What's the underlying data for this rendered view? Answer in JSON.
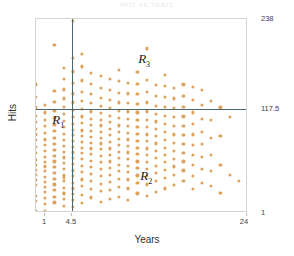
{
  "figure": {
    "title_faint": "Hits vs Years",
    "xlabel": "Years",
    "ylabel": "Hits"
  },
  "axes": {
    "x_ticks": [
      {
        "label": "1",
        "pos": 0.0425
      },
      {
        "label": "4.5",
        "pos": 0.17
      }
    ],
    "x_right_tick": {
      "label": "24",
      "pos": 1.0
    },
    "y_ticks": [
      {
        "label": "238",
        "pos": 1.0
      },
      {
        "label": "117.5",
        "pos": 0.537
      },
      {
        "label": "1",
        "pos": 0.0
      }
    ]
  },
  "regions": [
    {
      "name": "R1",
      "letter": "R",
      "sub": "1",
      "x": 0.105,
      "y": 0.475
    },
    {
      "name": "R2",
      "letter": "R",
      "sub": "2",
      "x": 0.52,
      "y": 0.185
    },
    {
      "name": "R3",
      "letter": "R",
      "sub": "3",
      "x": 0.51,
      "y": 0.79
    }
  ],
  "splits": {
    "vertical": {
      "variable": "Years",
      "value": 4.5,
      "pos": 0.17
    },
    "horizontal": {
      "variable": "Hits",
      "value": 117.5,
      "pos": 0.537
    }
  },
  "colors": {
    "point": "#dfa25c",
    "split_line": "#4a6670",
    "frame": "#d4d4d4",
    "text": "#3d3d3d"
  },
  "chart_data": {
    "type": "scatter",
    "title": "Hits vs Years",
    "xlabel": "Years",
    "ylabel": "Hits",
    "xlim": [
      1,
      24
    ],
    "ylim": [
      1,
      238
    ],
    "grid": false,
    "legend": null,
    "annotations": [
      {
        "text": "R1",
        "x": 3.4,
        "y": 114
      },
      {
        "text": "R2",
        "x": 13.0,
        "y": 45
      },
      {
        "text": "R3",
        "x": 12.7,
        "y": 189
      }
    ],
    "reference_lines": [
      {
        "orientation": "vertical",
        "value": 4.5,
        "label": "Years = 4.5"
      },
      {
        "orientation": "horizontal",
        "value": 117.5,
        "label": "Hits = 117.5"
      }
    ],
    "points": [
      [
        1,
        16
      ],
      [
        1,
        22
      ],
      [
        1,
        35
      ],
      [
        1,
        41
      ],
      [
        1,
        48
      ],
      [
        1,
        54
      ],
      [
        1,
        60
      ],
      [
        1,
        66
      ],
      [
        1,
        74
      ],
      [
        1,
        82
      ],
      [
        1,
        90
      ],
      [
        1,
        97
      ],
      [
        1,
        104
      ],
      [
        1,
        112
      ],
      [
        1,
        120
      ],
      [
        1,
        130
      ],
      [
        1,
        143
      ],
      [
        1,
        158
      ],
      [
        1,
        4
      ],
      [
        2,
        12
      ],
      [
        2,
        19
      ],
      [
        2,
        27
      ],
      [
        2,
        33
      ],
      [
        2,
        39
      ],
      [
        2,
        45
      ],
      [
        2,
        52
      ],
      [
        2,
        58
      ],
      [
        2,
        63
      ],
      [
        2,
        70
      ],
      [
        2,
        77
      ],
      [
        2,
        84
      ],
      [
        2,
        91
      ],
      [
        2,
        99
      ],
      [
        2,
        107
      ],
      [
        2,
        115
      ],
      [
        2,
        124
      ],
      [
        2,
        133
      ],
      [
        2,
        3
      ],
      [
        3,
        14
      ],
      [
        3,
        21
      ],
      [
        3,
        29
      ],
      [
        3,
        36
      ],
      [
        3,
        43
      ],
      [
        3,
        50
      ],
      [
        3,
        57
      ],
      [
        3,
        64
      ],
      [
        3,
        71
      ],
      [
        3,
        78
      ],
      [
        3,
        85
      ],
      [
        3,
        93
      ],
      [
        3,
        101
      ],
      [
        3,
        109
      ],
      [
        3,
        117
      ],
      [
        3,
        126
      ],
      [
        3,
        137
      ],
      [
        3,
        150
      ],
      [
        3,
        206
      ],
      [
        4,
        10
      ],
      [
        4,
        18
      ],
      [
        4,
        25
      ],
      [
        4,
        32
      ],
      [
        4,
        40
      ],
      [
        4,
        47
      ],
      [
        4,
        55
      ],
      [
        4,
        62
      ],
      [
        4,
        69
      ],
      [
        4,
        76
      ],
      [
        4,
        83
      ],
      [
        4,
        90
      ],
      [
        4,
        98
      ],
      [
        4,
        106
      ],
      [
        4,
        114
      ],
      [
        4,
        122
      ],
      [
        4,
        131
      ],
      [
        4,
        141
      ],
      [
        4,
        152
      ],
      [
        4,
        165
      ],
      [
        4,
        178
      ],
      [
        4,
        26
      ],
      [
        4,
        44
      ],
      [
        5,
        8
      ],
      [
        5,
        17
      ],
      [
        5,
        24
      ],
      [
        5,
        31
      ],
      [
        5,
        38
      ],
      [
        5,
        46
      ],
      [
        5,
        53
      ],
      [
        5,
        61
      ],
      [
        5,
        68
      ],
      [
        5,
        75
      ],
      [
        5,
        82
      ],
      [
        5,
        89
      ],
      [
        5,
        96
      ],
      [
        5,
        103
      ],
      [
        5,
        110
      ],
      [
        5,
        118
      ],
      [
        5,
        127
      ],
      [
        5,
        136
      ],
      [
        5,
        147
      ],
      [
        5,
        160
      ],
      [
        5,
        174
      ],
      [
        5,
        190
      ],
      [
        5,
        236
      ],
      [
        6,
        13
      ],
      [
        6,
        23
      ],
      [
        6,
        34
      ],
      [
        6,
        42
      ],
      [
        6,
        51
      ],
      [
        6,
        59
      ],
      [
        6,
        67
      ],
      [
        6,
        74
      ],
      [
        6,
        81
      ],
      [
        6,
        88
      ],
      [
        6,
        95
      ],
      [
        6,
        102
      ],
      [
        6,
        111
      ],
      [
        6,
        119
      ],
      [
        6,
        128
      ],
      [
        6,
        138
      ],
      [
        6,
        149
      ],
      [
        6,
        163
      ],
      [
        6,
        180
      ],
      [
        6,
        195
      ],
      [
        7,
        20
      ],
      [
        7,
        30
      ],
      [
        7,
        40
      ],
      [
        7,
        49
      ],
      [
        7,
        57
      ],
      [
        7,
        65
      ],
      [
        7,
        73
      ],
      [
        7,
        80
      ],
      [
        7,
        87
      ],
      [
        7,
        94
      ],
      [
        7,
        101
      ],
      [
        7,
        109
      ],
      [
        7,
        116
      ],
      [
        7,
        125
      ],
      [
        7,
        135
      ],
      [
        7,
        146
      ],
      [
        7,
        159
      ],
      [
        7,
        172
      ],
      [
        8,
        15
      ],
      [
        8,
        28
      ],
      [
        8,
        37
      ],
      [
        8,
        46
      ],
      [
        8,
        55
      ],
      [
        8,
        63
      ],
      [
        8,
        71
      ],
      [
        8,
        79
      ],
      [
        8,
        86
      ],
      [
        8,
        93
      ],
      [
        8,
        100
      ],
      [
        8,
        108
      ],
      [
        8,
        115
      ],
      [
        8,
        123
      ],
      [
        8,
        132
      ],
      [
        8,
        142
      ],
      [
        8,
        154
      ],
      [
        8,
        168
      ],
      [
        9,
        18
      ],
      [
        9,
        29
      ],
      [
        9,
        39
      ],
      [
        9,
        48
      ],
      [
        9,
        56
      ],
      [
        9,
        64
      ],
      [
        9,
        72
      ],
      [
        9,
        80
      ],
      [
        9,
        88
      ],
      [
        9,
        96
      ],
      [
        9,
        104
      ],
      [
        9,
        112
      ],
      [
        9,
        120
      ],
      [
        9,
        129
      ],
      [
        9,
        139
      ],
      [
        9,
        151
      ],
      [
        9,
        165
      ],
      [
        10,
        21
      ],
      [
        10,
        33
      ],
      [
        10,
        43
      ],
      [
        10,
        52
      ],
      [
        10,
        60
      ],
      [
        10,
        68
      ],
      [
        10,
        76
      ],
      [
        10,
        84
      ],
      [
        10,
        92
      ],
      [
        10,
        100
      ],
      [
        10,
        108
      ],
      [
        10,
        117
      ],
      [
        10,
        126
      ],
      [
        10,
        136
      ],
      [
        10,
        148
      ],
      [
        10,
        162
      ],
      [
        10,
        176
      ],
      [
        11,
        17
      ],
      [
        11,
        31
      ],
      [
        11,
        42
      ],
      [
        11,
        51
      ],
      [
        11,
        59
      ],
      [
        11,
        67
      ],
      [
        11,
        75
      ],
      [
        11,
        83
      ],
      [
        11,
        91
      ],
      [
        11,
        99
      ],
      [
        11,
        107
      ],
      [
        11,
        116
      ],
      [
        11,
        125
      ],
      [
        11,
        135
      ],
      [
        11,
        147
      ],
      [
        11,
        160
      ],
      [
        12,
        25
      ],
      [
        12,
        38
      ],
      [
        12,
        47
      ],
      [
        12,
        56
      ],
      [
        12,
        64
      ],
      [
        12,
        73
      ],
      [
        12,
        81
      ],
      [
        12,
        89
      ],
      [
        12,
        98
      ],
      [
        12,
        106
      ],
      [
        12,
        115
      ],
      [
        12,
        124
      ],
      [
        12,
        134
      ],
      [
        12,
        146
      ],
      [
        12,
        159
      ],
      [
        12,
        173
      ],
      [
        13,
        22
      ],
      [
        13,
        36
      ],
      [
        13,
        46
      ],
      [
        13,
        55
      ],
      [
        13,
        63
      ],
      [
        13,
        72
      ],
      [
        13,
        80
      ],
      [
        13,
        89
      ],
      [
        13,
        97
      ],
      [
        13,
        106
      ],
      [
        13,
        115
      ],
      [
        13,
        125
      ],
      [
        13,
        136
      ],
      [
        13,
        149
      ],
      [
        13,
        164
      ],
      [
        13,
        202
      ],
      [
        14,
        27
      ],
      [
        14,
        40
      ],
      [
        14,
        50
      ],
      [
        14,
        59
      ],
      [
        14,
        68
      ],
      [
        14,
        77
      ],
      [
        14,
        86
      ],
      [
        14,
        95
      ],
      [
        14,
        104
      ],
      [
        14,
        113
      ],
      [
        14,
        122
      ],
      [
        14,
        132
      ],
      [
        14,
        144
      ],
      [
        14,
        157
      ],
      [
        15,
        31
      ],
      [
        15,
        44
      ],
      [
        15,
        54
      ],
      [
        15,
        63
      ],
      [
        15,
        72
      ],
      [
        15,
        81
      ],
      [
        15,
        90
      ],
      [
        15,
        100
      ],
      [
        15,
        110
      ],
      [
        15,
        120
      ],
      [
        15,
        131
      ],
      [
        15,
        143
      ],
      [
        15,
        156
      ],
      [
        15,
        170
      ],
      [
        16,
        35
      ],
      [
        16,
        48
      ],
      [
        16,
        58
      ],
      [
        16,
        67
      ],
      [
        16,
        77
      ],
      [
        16,
        87
      ],
      [
        16,
        97
      ],
      [
        16,
        107
      ],
      [
        16,
        118
      ],
      [
        16,
        129
      ],
      [
        16,
        141
      ],
      [
        16,
        154
      ],
      [
        17,
        40
      ],
      [
        17,
        53
      ],
      [
        17,
        64
      ],
      [
        17,
        74
      ],
      [
        17,
        85
      ],
      [
        17,
        96
      ],
      [
        17,
        107
      ],
      [
        17,
        119
      ],
      [
        17,
        131
      ],
      [
        17,
        144
      ],
      [
        17,
        158
      ],
      [
        18,
        30
      ],
      [
        18,
        46
      ],
      [
        18,
        60
      ],
      [
        18,
        72
      ],
      [
        18,
        84
      ],
      [
        18,
        97
      ],
      [
        18,
        110
      ],
      [
        18,
        124
      ],
      [
        18,
        139
      ],
      [
        18,
        155
      ],
      [
        19,
        38
      ],
      [
        19,
        55
      ],
      [
        19,
        70
      ],
      [
        19,
        85
      ],
      [
        19,
        100
      ],
      [
        19,
        116
      ],
      [
        19,
        133
      ],
      [
        19,
        151
      ],
      [
        20,
        34
      ],
      [
        20,
        52
      ],
      [
        20,
        72
      ],
      [
        20,
        93
      ],
      [
        20,
        115
      ],
      [
        20,
        138
      ],
      [
        21,
        26
      ],
      [
        21,
        60
      ],
      [
        21,
        95
      ],
      [
        21,
        130
      ],
      [
        22,
        48
      ],
      [
        22,
        118
      ],
      [
        23,
        40
      ],
      [
        24,
        57
      ]
    ]
  }
}
